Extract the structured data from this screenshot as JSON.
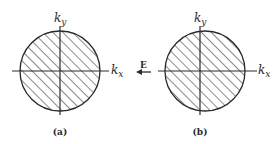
{
  "figure": {
    "panels": [
      {
        "id": "a",
        "caption": "(a)",
        "x_axis_label": "k",
        "x_axis_sub": "x",
        "y_axis_label": "k",
        "y_axis_sub": "y",
        "description": "Fermi sphere centered at origin, hatched occupied region"
      },
      {
        "id": "b",
        "caption": "(b)",
        "x_axis_label": "k",
        "x_axis_sub": "x",
        "y_axis_label": "k",
        "y_axis_sub": "y",
        "description": "Fermi sphere displaced along +kx under applied field"
      }
    ],
    "field_label": "E",
    "field_direction": "left",
    "colors": {
      "stroke": "#2a2a2a",
      "background": "#ffffff"
    }
  }
}
